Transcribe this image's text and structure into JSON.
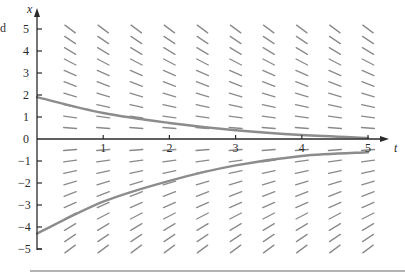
{
  "cropped_text": "d",
  "chart_data": {
    "type": "line",
    "title": "",
    "xlabel": "t",
    "ylabel": "x",
    "xlim": [
      0,
      5
    ],
    "ylim": [
      -5,
      5
    ],
    "x_ticks": [
      1,
      2,
      3,
      4,
      5
    ],
    "y_ticks": [
      5,
      4,
      3,
      2,
      1,
      0,
      -1,
      -2,
      -3,
      -4,
      -5
    ],
    "grid": false,
    "legend": null,
    "slope_field": {
      "equation_form": "dx/dt = -k x (slopes depend on x only)",
      "k_estimate": 0.45,
      "t_samples": [
        0.5,
        1,
        1.5,
        2,
        2.5,
        3,
        3.5,
        4,
        4.5,
        5
      ],
      "x_samples": [
        5,
        4.5,
        4,
        3.5,
        3,
        2.5,
        2,
        1.5,
        1,
        0.5,
        -0.5,
        -1,
        -1.5,
        -2,
        -2.5,
        -3,
        -3.5,
        -4,
        -4.5,
        -5
      ]
    },
    "series": [
      {
        "name": "solution-upper",
        "t": [
          0,
          1,
          2,
          3,
          4,
          5
        ],
        "x": [
          1.9,
          1.18,
          0.73,
          0.4,
          0.18,
          0.05
        ]
      },
      {
        "name": "solution-lower",
        "t": [
          0,
          1,
          2,
          3,
          4,
          5
        ],
        "x": [
          -4.3,
          -2.85,
          -1.9,
          -1.2,
          -0.77,
          -0.6
        ]
      }
    ],
    "colors": {
      "axis": "#2a2a2a",
      "segment": "#8a8a8a",
      "curve": "#8c8c8c",
      "rule": "#9a9a9a"
    }
  }
}
